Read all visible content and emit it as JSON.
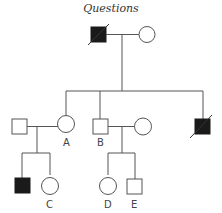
{
  "title": "Questions",
  "colors": {
    "line": "#555555",
    "affected": "#1a1a1a",
    "unaffected": "#ffffff"
  },
  "individuals": [
    {
      "id": "I-1",
      "sex": "male",
      "affected": true,
      "deceased": true,
      "label": ""
    },
    {
      "id": "I-2",
      "sex": "female",
      "affected": false,
      "deceased": false,
      "label": ""
    },
    {
      "id": "II-1",
      "sex": "male",
      "affected": false,
      "deceased": false,
      "label": ""
    },
    {
      "id": "II-2",
      "sex": "female",
      "affected": false,
      "deceased": false,
      "label": "A"
    },
    {
      "id": "II-3",
      "sex": "male",
      "affected": false,
      "deceased": false,
      "label": "B"
    },
    {
      "id": "II-4",
      "sex": "female",
      "affected": false,
      "deceased": false,
      "label": ""
    },
    {
      "id": "II-5",
      "sex": "male",
      "affected": true,
      "deceased": true,
      "label": ""
    },
    {
      "id": "III-1",
      "sex": "male",
      "affected": true,
      "deceased": false,
      "label": ""
    },
    {
      "id": "III-2",
      "sex": "female",
      "affected": false,
      "deceased": false,
      "label": "C"
    },
    {
      "id": "III-3",
      "sex": "female",
      "affected": false,
      "deceased": false,
      "label": "D"
    },
    {
      "id": "III-4",
      "sex": "male",
      "affected": false,
      "deceased": false,
      "label": "E"
    }
  ],
  "labels": {
    "A": "A",
    "B": "B",
    "C": "C",
    "D": "D",
    "E": "E"
  }
}
